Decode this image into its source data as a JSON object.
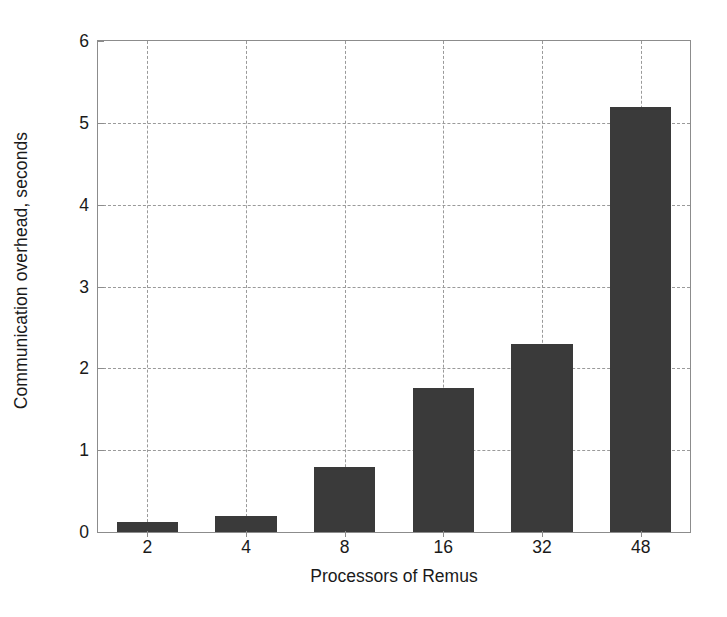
{
  "chart_data": {
    "type": "bar",
    "title": "",
    "subtitle": "",
    "xlabel": "Processors of Remus",
    "ylabel": "Communication overhead, seconds",
    "categories": [
      "2",
      "4",
      "8",
      "16",
      "32",
      "48"
    ],
    "values": [
      0.12,
      0.19,
      0.8,
      1.76,
      2.3,
      5.19
    ],
    "ylim": [
      0,
      6
    ],
    "yticks": [
      "0",
      "1",
      "2",
      "3",
      "4",
      "5",
      "6"
    ],
    "ytick_values": [
      0,
      1,
      2,
      3,
      4,
      5,
      6
    ],
    "xticks": [
      "2",
      "4",
      "8",
      "16",
      "32",
      "48"
    ],
    "grid": "dashed both axes",
    "legend": "none",
    "bar_color": "#3a3a3a",
    "grid_color": "#9a9a9a",
    "axis_color": "#8c8c8c",
    "background_color": "#ffffff",
    "annotations": []
  }
}
